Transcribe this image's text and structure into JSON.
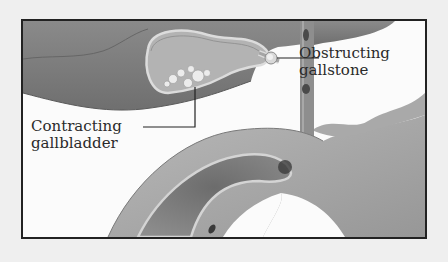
{
  "figure": {
    "type": "medical-illustration",
    "labels": [
      {
        "id": "obstructing-gallstone",
        "lines": [
          "Obstructing",
          "gallstone"
        ]
      },
      {
        "id": "contracting-gallbladder",
        "lines": [
          "Contracting",
          "gallbladder"
        ]
      }
    ],
    "colors": {
      "page_background": "#efefef",
      "frame_border": "#222222",
      "frame_fill": "#fbfbfb",
      "liver_tissue": "#7d7d7d",
      "gallbladder_fill": "#b5b5b5",
      "wall_highlight": "#dcdcdc",
      "duodenum": "#a9a9a9",
      "label_text": "#2a2a2a"
    }
  }
}
